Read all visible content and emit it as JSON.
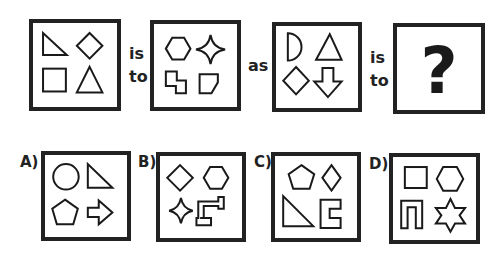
{
  "puzzle": {
    "connectors": {
      "is_to_1": [
        "is",
        "to"
      ],
      "as": "as",
      "is_to_2": [
        "is",
        "to"
      ]
    },
    "question_mark": "?",
    "top_row": [
      {
        "name": "example-source",
        "shapes": [
          "right-triangle",
          "diamond",
          "square",
          "triangle"
        ]
      },
      {
        "name": "example-target",
        "shapes": [
          "hexagon",
          "four-point-star",
          "stepped-polygon",
          "l-shape"
        ]
      },
      {
        "name": "query-source",
        "shapes": [
          "half-circle",
          "triangle",
          "diamond",
          "down-arrow"
        ]
      },
      {
        "name": "query-target",
        "shapes": [
          "question-mark"
        ]
      }
    ],
    "options": [
      {
        "label": "A)",
        "shapes": [
          "circle",
          "right-triangle",
          "pentagon",
          "right-arrow"
        ]
      },
      {
        "label": "B)",
        "shapes": [
          "diamond",
          "hexagon",
          "four-point-star",
          "zigzag-polygon"
        ]
      },
      {
        "label": "C)",
        "shapes": [
          "pentagon",
          "diamond",
          "right-triangle",
          "c-bracket"
        ]
      },
      {
        "label": "D)",
        "shapes": [
          "square",
          "hexagon",
          "u-shape",
          "six-point-star"
        ]
      }
    ]
  }
}
